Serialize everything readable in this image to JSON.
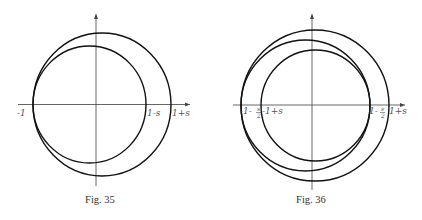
{
  "figures": [
    {
      "caption": "Fig. 35",
      "labels": {
        "left": "-1",
        "inner_right": "1-s",
        "outer_right": "1+s"
      },
      "description": "Two circles tangent at -1 on the real axis; inner circle crosses at 1-s, outer circle at 1+s"
    },
    {
      "caption": "Fig. 36",
      "labels": {
        "left_outer_a": "-1-",
        "left_outer_frac_num": "s",
        "left_outer_frac_den": "2",
        "left_inner": "-1+s",
        "right_inner_a": "1-",
        "right_inner_frac_num": "s",
        "right_inner_frac_den": "2",
        "right_outer": "1+s"
      },
      "description": "Three nested circles on real axis with intercepts -1-s/2, -1+s, 1-s/2, 1+s"
    }
  ]
}
